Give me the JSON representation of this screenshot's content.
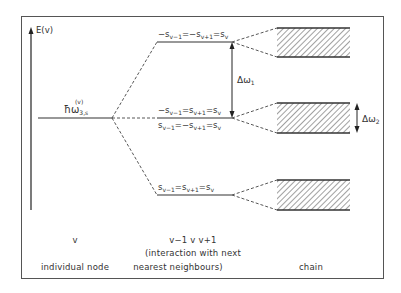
{
  "diagram": {
    "axis_label": "E(v)",
    "node_level_label": {
      "base": "ħω",
      "subscript": "3,s",
      "superscript": "(v)"
    },
    "levels": [
      {
        "id": "upper",
        "label": "−s_{v−1}=−s_{v+1}=s_v",
        "display": [
          "−s",
          "v−1",
          "=−s",
          "v+1",
          "=s",
          "v"
        ]
      },
      {
        "id": "middle_top",
        "label": "−s_{v−1}=s_{v+1}=s_v",
        "display": [
          "−s",
          "v−1",
          "=s",
          "v+1",
          "=s",
          "v"
        ]
      },
      {
        "id": "middle_bottom",
        "label": "s_{v−1}=−s_{v+1}=s_v",
        "display": [
          "s",
          "v−1",
          "=−s",
          "v+1",
          "=s",
          "v"
        ]
      },
      {
        "id": "lower",
        "label": "s_{v−1}=s_{v+1}=s_v",
        "display": [
          "s",
          "v−1",
          "=s",
          "v+1",
          "=s",
          "v"
        ]
      }
    ],
    "delta_omega_1": {
      "base": "Δω",
      "sub": "1"
    },
    "delta_omega_2": {
      "base": "Δω",
      "sub": "2"
    },
    "bands": [
      {
        "id": "band-upper"
      },
      {
        "id": "band-middle"
      },
      {
        "id": "band-lower"
      }
    ],
    "columns": {
      "node": {
        "symbol": "v",
        "caption": "individual node"
      },
      "neighbours": {
        "symbol": "v−1  v  v+1",
        "caption_line1": "(interaction with next",
        "caption_line2": "nearest neighbours)"
      },
      "chain": {
        "caption": "chain"
      }
    },
    "colors": {
      "line": "#333333",
      "frame": "#555555",
      "hatch": "#444444"
    }
  }
}
